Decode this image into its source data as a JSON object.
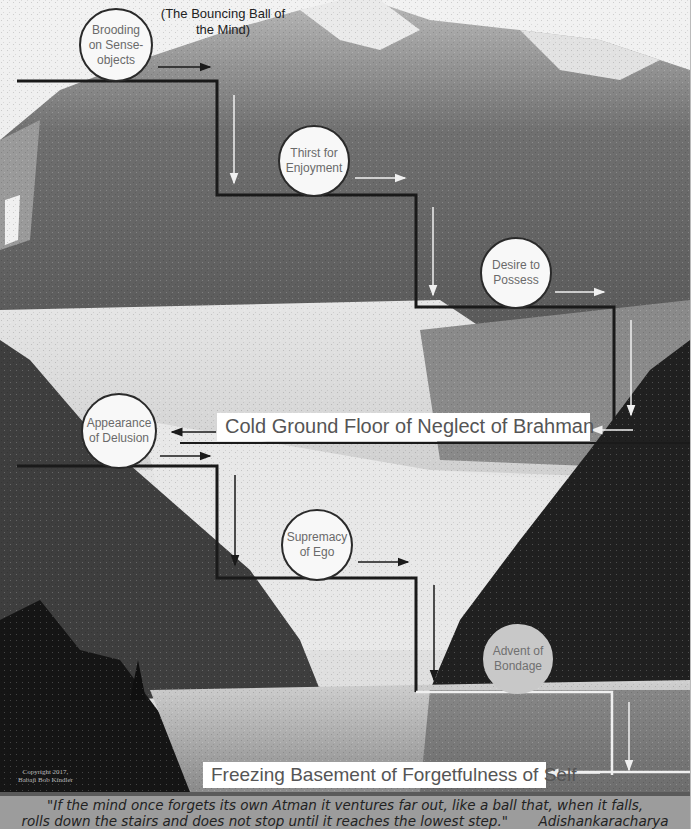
{
  "diagram": {
    "subtitle": "(The Bouncing Ball of the Mind)",
    "stages": [
      {
        "label": "Brooding on Sense-objects",
        "lines": [
          "Brooding",
          "on Sense-",
          "objects"
        ],
        "style": "white"
      },
      {
        "label": "Thirst for Enjoyment",
        "lines": [
          "Thirst for",
          "Enjoyment"
        ],
        "style": "white"
      },
      {
        "label": "Desire to Possess",
        "lines": [
          "Desire to",
          "Possess"
        ],
        "style": "white"
      },
      {
        "label": "Appearance of Delusion",
        "lines": [
          "Appearance",
          "of Delusion"
        ],
        "style": "white"
      },
      {
        "label": "Supremacy of Ego",
        "lines": [
          "Supremacy",
          "of Ego"
        ],
        "style": "white"
      },
      {
        "label": "Advent of Bondage",
        "lines": [
          "Advent of",
          "Bondage"
        ],
        "style": "grey"
      }
    ],
    "floors": {
      "ground": "Cold Ground Floor of Neglect of Brahman",
      "basement": "Freezing Basement of Forgetfulness of Self"
    },
    "copyright": [
      "Copyright 2017,",
      "Babaji Bob Kindler"
    ],
    "quote": {
      "line1": "\"If the mind once forgets its own Atman it ventures far out, like a ball that, when it falls,",
      "line2": "rolls down the stairs and does not stop until it reaches the lowest step.\"",
      "attribution": "Adishankaracharya"
    },
    "colors": {
      "stair_dark": "#1a1a1a",
      "stair_light": "#f0f0f0",
      "ball_white": "#f8f8f8",
      "ball_grey": "#c8c8c8",
      "quote_band": "#9c9c9c"
    }
  }
}
